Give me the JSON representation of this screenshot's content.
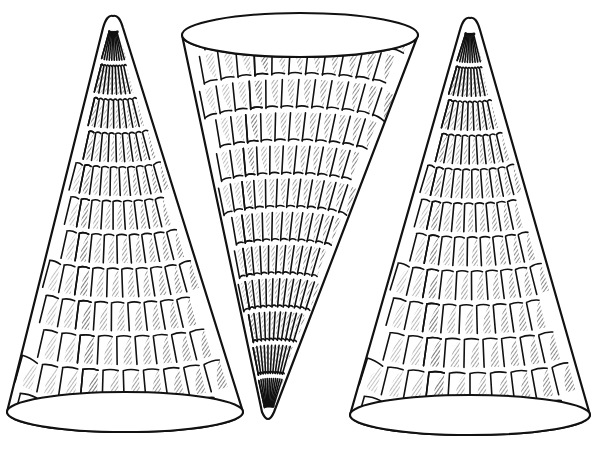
{
  "illustration": {
    "subject": "three waffle cones line drawing",
    "background": "#ffffff",
    "ink": "#111111",
    "cones": [
      {
        "id": "left",
        "orientation": "upright",
        "apex": [
          113,
          16
        ],
        "ellipse": {
          "cx": 125,
          "cy": 412,
          "rx": 118,
          "ry": 20
        },
        "rows": 12,
        "cols": 5
      },
      {
        "id": "middle",
        "orientation": "inverted",
        "apex": [
          268,
          422
        ],
        "ellipse": {
          "cx": 300,
          "cy": 35,
          "rx": 118,
          "ry": 22
        },
        "rows": 12,
        "cols": 6
      },
      {
        "id": "right",
        "orientation": "upright",
        "apex": [
          470,
          18
        ],
        "ellipse": {
          "cx": 470,
          "cy": 415,
          "rx": 120,
          "ry": 20
        },
        "rows": 12,
        "cols": 5
      }
    ]
  }
}
